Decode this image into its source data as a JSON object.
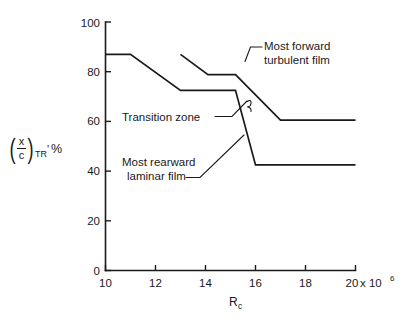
{
  "chart_data": {
    "type": "line",
    "title": "",
    "xlabel": "R_c",
    "xlabel_base": "R",
    "xlabel_sub": "c",
    "ylabel": "(x/c)_TR, %",
    "ylabel_num": "x",
    "ylabel_den": "c",
    "ylabel_sub": "TR",
    "ylabel_prime": "'",
    "ylabel_unit": "%",
    "xlim": [
      10,
      20
    ],
    "ylim": [
      0,
      100
    ],
    "x_ticks": [
      10,
      12,
      14,
      16,
      18,
      20
    ],
    "x_tick_labels": [
      "10",
      "12",
      "14",
      "16",
      "18",
      "20"
    ],
    "x_multiplier_text": "x 10",
    "x_multiplier_exponent": "6",
    "y_ticks": [
      0,
      20,
      40,
      60,
      80,
      100
    ],
    "y_tick_labels": [
      "0",
      "20",
      "40",
      "60",
      "80",
      "100"
    ],
    "grid": false,
    "legend": "none",
    "series": [
      {
        "name": "Most rearward laminar film",
        "points": [
          [
            10,
            87
          ],
          [
            11,
            87
          ],
          [
            13,
            72.5
          ],
          [
            15.2,
            72.5
          ],
          [
            16,
            42.5
          ],
          [
            20,
            42.5
          ]
        ]
      },
      {
        "name": "Most forward turbulent film",
        "points": [
          [
            13,
            87
          ],
          [
            14.1,
            78.8
          ],
          [
            15.2,
            78.8
          ],
          [
            17,
            60.5
          ],
          [
            20,
            60.5
          ]
        ]
      }
    ],
    "annotations": [
      {
        "id": "most-forward-turbulent-film",
        "line1": "Most forward",
        "line2": "turbulent film"
      },
      {
        "id": "transition-zone",
        "line1": "Transition zone",
        "line2": ""
      },
      {
        "id": "most-rearward-laminar-film",
        "line1": "Most rearward",
        "line2": "laminar film"
      }
    ]
  }
}
